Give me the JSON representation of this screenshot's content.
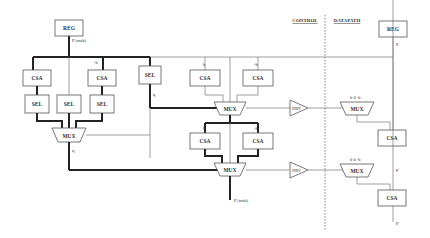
{
  "sections": {
    "control": "CONTROL",
    "datapath": "DATAPATH"
  },
  "blocks": {
    "reg_left": "REG",
    "reg_right": "REG",
    "csa": "CSA",
    "sel": "SEL",
    "mux": "MUX",
    "drv": "DRV"
  },
  "signals": {
    "p_j_msb": "P (msb)",
    "p_j_sub": "j",
    "p_j": "P",
    "q_j": "q",
    "q_j_sub": "j",
    "q_j1": "q",
    "q_j1_sub": "j+1",
    "p_j2_msb": "P (msb)",
    "p_j2_sub": "j+2",
    "p_j1": "P",
    "p_j1_sub": "j+1",
    "p_j2": "P",
    "p_j2b_sub": "j+2",
    "b": "b",
    "neg_b": "-b",
    "zero": "0"
  }
}
